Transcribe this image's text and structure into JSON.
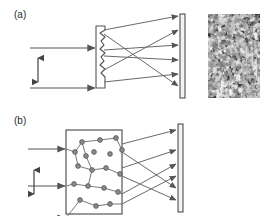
{
  "figure": {
    "background_color": "#ffffff",
    "ink_color": "#555555",
    "label_color": "#2b2b2b",
    "width": 269,
    "height": 216
  },
  "panels": [
    {
      "id": "a",
      "label": "(a)",
      "scattering_element": "rough-surface-diffuser",
      "element_description": "thin vertical slab with a jagged / corrugated right-hand surface",
      "incident_beam": {
        "ray_count": 3,
        "direction": "left-to-right",
        "ray_y": [
          48,
          88,
          122
        ],
        "polarization_marker": "vertical double-headed arrow"
      },
      "scattered_rays": 6,
      "observation_screen": "vertical bar at right of diagram",
      "speckle_image": {
        "name": "fine-speckle-pattern",
        "grain_size": "small",
        "description": "dense fine-grained random speckle",
        "seed": 17,
        "grain_count": 2300,
        "mean_radius": 1.1,
        "ring_count": 0,
        "streak_count": 14
      }
    },
    {
      "id": "b",
      "label": "(b)",
      "scattering_element": "multiple-scattering-medium",
      "element_description": "rectangular box filled with randomly placed scattering particles and zig-zag photon paths",
      "incident_beam": {
        "ray_count": 3,
        "direction": "left-to-right",
        "ray_y": [
          41,
          78,
          110
        ],
        "polarization_marker": "vertical double-headed arrow"
      },
      "scattered_rays": 6,
      "observation_screen": "vertical bar at right of diagram",
      "particle_count": 19,
      "speckle_image": {
        "name": "coarse-speckle-pattern",
        "grain_size": "large",
        "description": "coarse speckle with large bright rings and elongated ellipses",
        "seed": 42,
        "grain_count": 1500,
        "mean_radius": 1.0,
        "ring_count": 11,
        "streak_count": 8
      }
    }
  ],
  "geometry": {
    "panel_a": {
      "incident_rays": [
        {
          "x1": 30,
          "y1": 48,
          "x2": 96,
          "y2": 48
        },
        {
          "x1": 30,
          "y1": 88,
          "x2": 96,
          "y2": 88
        },
        {
          "x1": 30,
          "y1": 122,
          "x2": 96,
          "y2": 122
        }
      ],
      "arrow": {
        "x": 38,
        "y_top": 58,
        "y_bottom": 82
      },
      "diffuser": {
        "x": 96,
        "y_top": 26,
        "y_bottom": 88,
        "width": 9
      },
      "screen": {
        "x": 180,
        "y_top": 14,
        "y_bottom": 98,
        "width": 5
      },
      "scattered_rays": [
        {
          "x1": 105,
          "y1": 30,
          "x2": 179,
          "y2": 16
        },
        {
          "x1": 105,
          "y1": 34,
          "x2": 179,
          "y2": 86
        },
        {
          "x1": 105,
          "y1": 50,
          "x2": 179,
          "y2": 45
        },
        {
          "x1": 105,
          "y1": 56,
          "x2": 179,
          "y2": 60
        },
        {
          "x1": 105,
          "y1": 70,
          "x2": 179,
          "y2": 30
        },
        {
          "x1": 105,
          "y1": 80,
          "x2": 179,
          "y2": 74
        }
      ]
    },
    "panel_b": {
      "incident_rays": [
        {
          "x1": 28,
          "y1": 41,
          "x2": 66,
          "y2": 41
        },
        {
          "x1": 28,
          "y1": 78,
          "x2": 66,
          "y2": 78
        },
        {
          "x1": 28,
          "y1": 110,
          "x2": 66,
          "y2": 110
        }
      ],
      "arrow": {
        "x": 34,
        "y_top": 62,
        "y_bottom": 86
      },
      "medium_box": {
        "x": 66,
        "y": 22,
        "width": 56,
        "height": 84
      },
      "screen": {
        "x": 178,
        "y_top": 16,
        "y_bottom": 104,
        "width": 5
      },
      "scattered_rays": [
        {
          "x1": 122,
          "y1": 36,
          "x2": 177,
          "y2": 22
        },
        {
          "x1": 122,
          "y1": 44,
          "x2": 177,
          "y2": 80
        },
        {
          "x1": 122,
          "y1": 60,
          "x2": 177,
          "y2": 42
        },
        {
          "x1": 122,
          "y1": 68,
          "x2": 177,
          "y2": 92
        },
        {
          "x1": 122,
          "y1": 86,
          "x2": 177,
          "y2": 56
        },
        {
          "x1": 122,
          "y1": 96,
          "x2": 177,
          "y2": 68
        }
      ],
      "particles": [
        [
          82,
          34
        ],
        [
          100,
          32
        ],
        [
          116,
          30
        ],
        [
          75,
          44
        ],
        [
          94,
          44
        ],
        [
          110,
          46
        ],
        [
          122,
          42
        ],
        [
          78,
          58
        ],
        [
          92,
          62
        ],
        [
          106,
          60
        ],
        [
          120,
          66
        ],
        [
          74,
          76
        ],
        [
          88,
          78
        ],
        [
          104,
          80
        ],
        [
          118,
          84
        ],
        [
          80,
          92
        ],
        [
          96,
          98
        ],
        [
          110,
          96
        ],
        [
          86,
          48
        ]
      ]
    }
  }
}
